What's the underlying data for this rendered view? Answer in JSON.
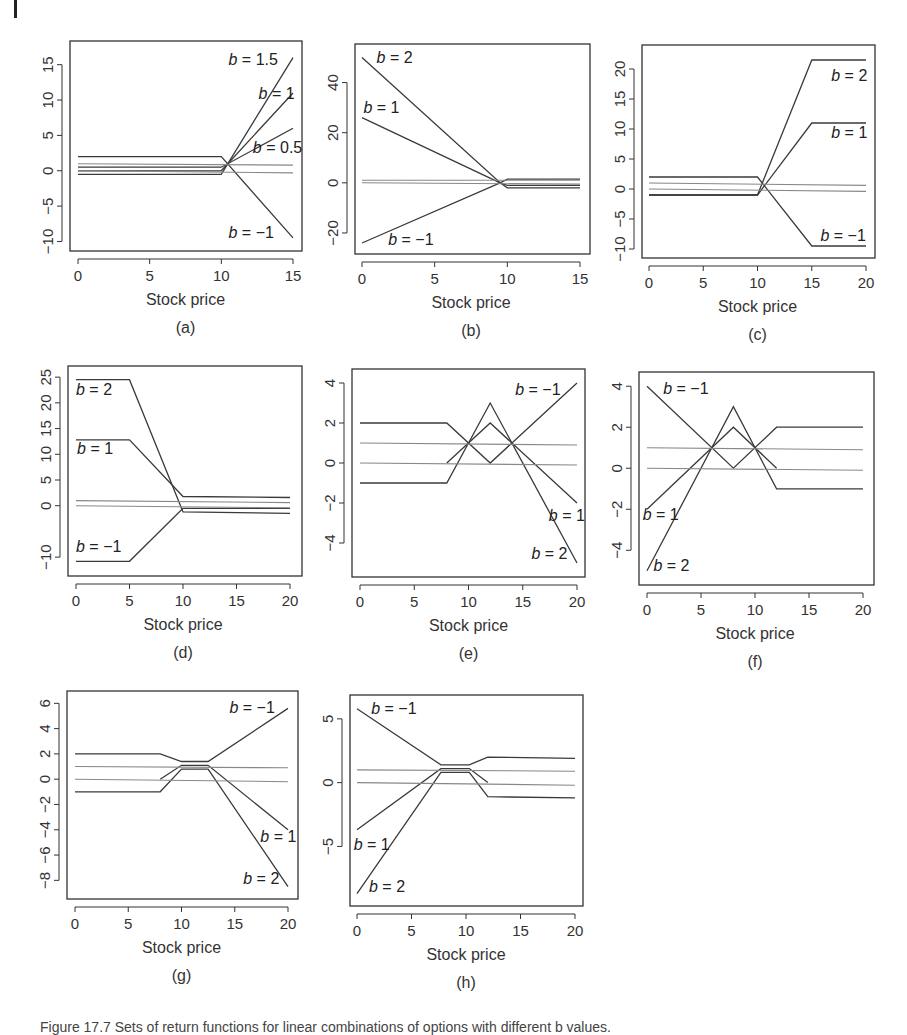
{
  "document": {
    "caption": "Figure 17.7  Sets of return functions for linear combinations of options with different b values."
  },
  "chart_data": [
    {
      "id": "a",
      "type": "line",
      "panel_label": "(a)",
      "xlabel": "Stock price",
      "ylabel": "",
      "xlim": [
        0,
        15
      ],
      "ylim": [
        -10.5,
        17.5
      ],
      "xticks": [
        0,
        5,
        10,
        15
      ],
      "yticks": [
        -10,
        -5,
        0,
        5,
        10,
        15
      ],
      "series": [
        {
          "name": "b=1.5",
          "x": [
            0,
            10,
            15
          ],
          "y": [
            -0.5,
            -0.5,
            16
          ]
        },
        {
          "name": "b=1",
          "x": [
            0,
            10,
            15
          ],
          "y": [
            0,
            0,
            11
          ]
        },
        {
          "name": "b=0.5",
          "x": [
            0,
            10,
            15
          ],
          "y": [
            0.5,
            0.5,
            6
          ]
        },
        {
          "name": "b=-1",
          "x": [
            0,
            10,
            15
          ],
          "y": [
            2,
            2,
            -9.5
          ]
        },
        {
          "name": "ref1",
          "x": [
            0,
            15
          ],
          "y": [
            1,
            0.8
          ],
          "color": "#888"
        },
        {
          "name": "ref0",
          "x": [
            0,
            15
          ],
          "y": [
            0,
            -0.3
          ],
          "color": "#888"
        }
      ],
      "annotations": [
        {
          "text": "b = 1.5",
          "x": 10.5,
          "y": 15
        },
        {
          "text": "b = 1",
          "x": 12.6,
          "y": 10.2
        },
        {
          "text": "b = 0.5",
          "x": 12.2,
          "y": 2.5
        },
        {
          "text": "b = −1",
          "x": 10.5,
          "y": -9.5
        }
      ]
    },
    {
      "id": "b",
      "type": "line",
      "panel_label": "(b)",
      "xlabel": "Stock price",
      "ylabel": "",
      "xlim": [
        0,
        15
      ],
      "ylim": [
        -26,
        53
      ],
      "xticks": [
        0,
        5,
        10,
        15
      ],
      "yticks": [
        -20,
        0,
        20,
        40
      ],
      "series": [
        {
          "name": "b=2",
          "x": [
            0,
            9.5,
            10,
            15
          ],
          "y": [
            50,
            0,
            -1,
            -1
          ]
        },
        {
          "name": "b=1",
          "x": [
            0,
            9.5,
            10,
            15
          ],
          "y": [
            26,
            0,
            -2,
            -2
          ]
        },
        {
          "name": "b=-1",
          "x": [
            0,
            9.5,
            10,
            15
          ],
          "y": [
            -24,
            0,
            1.5,
            1.5
          ]
        },
        {
          "name": "ref1",
          "x": [
            0,
            15
          ],
          "y": [
            1,
            1
          ],
          "color": "#888"
        },
        {
          "name": "ref0",
          "x": [
            0,
            15
          ],
          "y": [
            0,
            -0.5
          ],
          "color": "#888"
        }
      ],
      "annotations": [
        {
          "text": "b = 2",
          "x": 1.0,
          "y": 48
        },
        {
          "text": "b = 1",
          "x": 0.1,
          "y": 28
        },
        {
          "text": "b = −1",
          "x": 1.8,
          "y": -25
        }
      ]
    },
    {
      "id": "c",
      "type": "line",
      "panel_label": "(c)",
      "xlabel": "Stock price",
      "ylabel": "",
      "xlim": [
        0,
        20.5
      ],
      "ylim": [
        -10.5,
        23
      ],
      "xticks": [
        0,
        5,
        10,
        15,
        20
      ],
      "yticks": [
        -10,
        -5,
        0,
        5,
        10,
        15,
        20
      ],
      "series": [
        {
          "name": "b=2",
          "x": [
            0,
            10,
            15,
            20
          ],
          "y": [
            -1,
            -1,
            21.5,
            21.5
          ]
        },
        {
          "name": "b=1",
          "x": [
            0,
            10,
            15,
            20
          ],
          "y": [
            -1,
            -1,
            11,
            11
          ]
        },
        {
          "name": "b=-1",
          "x": [
            0,
            10,
            15,
            20
          ],
          "y": [
            2,
            2,
            -9.5,
            -9.5
          ]
        },
        {
          "name": "ref1",
          "x": [
            0,
            20
          ],
          "y": [
            1,
            0.6
          ],
          "color": "#888"
        },
        {
          "name": "ref0",
          "x": [
            0,
            20
          ],
          "y": [
            0,
            -0.4
          ],
          "color": "#888"
        }
      ],
      "annotations": [
        {
          "text": "b = 2",
          "x": 16.8,
          "y": 18
        },
        {
          "text": "b = 1",
          "x": 16.8,
          "y": 8.5
        },
        {
          "text": "b = −1",
          "x": 15.8,
          "y": -8.6
        }
      ]
    },
    {
      "id": "d",
      "type": "line",
      "panel_label": "(d)",
      "xlabel": "Stock price",
      "ylabel": "",
      "xlim": [
        0,
        20.5
      ],
      "ylim": [
        -12.5,
        26
      ],
      "xticks": [
        0,
        5,
        10,
        15,
        20
      ],
      "yticks": [
        -10,
        0,
        5,
        10,
        15,
        20,
        25
      ],
      "series": [
        {
          "name": "b=2",
          "x": [
            0,
            5,
            10,
            20
          ],
          "y": [
            24.5,
            24.5,
            -1.2,
            -1.5
          ]
        },
        {
          "name": "b=1",
          "x": [
            0,
            5,
            10,
            20
          ],
          "y": [
            12.8,
            12.8,
            1.8,
            1.6
          ]
        },
        {
          "name": "b=-1",
          "x": [
            0,
            5,
            10,
            20
          ],
          "y": [
            -10.8,
            -10.8,
            -0.5,
            -0.5
          ]
        },
        {
          "name": "ref1",
          "x": [
            0,
            20
          ],
          "y": [
            1,
            0.6
          ],
          "color": "#888"
        },
        {
          "name": "ref0",
          "x": [
            0,
            20
          ],
          "y": [
            0,
            -0.4
          ],
          "color": "#888"
        }
      ],
      "annotations": [
        {
          "text": "b = 2",
          "x": 0.0,
          "y": 21.5
        },
        {
          "text": "b = 1",
          "x": 0.1,
          "y": 10
        },
        {
          "text": "b = −1",
          "x": 0.0,
          "y": -9
        }
      ]
    },
    {
      "id": "e",
      "type": "line",
      "panel_label": "(e)",
      "xlabel": "Stock price",
      "ylabel": "",
      "xlim": [
        0,
        20.5
      ],
      "ylim": [
        -5.4,
        4.4
      ],
      "xticks": [
        0,
        5,
        10,
        15,
        20
      ],
      "yticks": [
        -4,
        -2,
        0,
        2,
        4
      ],
      "series": [
        {
          "name": "b=-1",
          "x": [
            0,
            8,
            12,
            16,
            20
          ],
          "y": [
            2,
            2,
            0,
            2,
            4
          ]
        },
        {
          "name": "b=1",
          "x": [
            8,
            12,
            20
          ],
          "y": [
            0,
            2,
            -2
          ]
        },
        {
          "name": "b=2",
          "x": [
            0,
            8,
            12,
            20
          ],
          "y": [
            -1,
            -1,
            3,
            -5
          ]
        },
        {
          "name": "ref1",
          "x": [
            0,
            20
          ],
          "y": [
            1,
            0.9
          ],
          "color": "#888"
        },
        {
          "name": "ref0",
          "x": [
            0,
            20
          ],
          "y": [
            0,
            -0.1
          ],
          "color": "#888"
        }
      ],
      "annotations": [
        {
          "text": "b = −1",
          "x": 14.3,
          "y": 3.4
        },
        {
          "text": "b = 1",
          "x": 17.4,
          "y": -2.9
        },
        {
          "text": "b = 2",
          "x": 15.8,
          "y": -4.8
        }
      ]
    },
    {
      "id": "f",
      "type": "line",
      "panel_label": "(f)",
      "xlabel": "Stock price",
      "ylabel": "",
      "xlim": [
        0,
        20.5
      ],
      "ylim": [
        -5.4,
        4.4
      ],
      "xticks": [
        0,
        5,
        10,
        15,
        20
      ],
      "yticks": [
        -4,
        -2,
        0,
        2,
        4
      ],
      "series": [
        {
          "name": "b=-1",
          "x": [
            0,
            8,
            12,
            20
          ],
          "y": [
            4,
            0,
            2,
            2
          ]
        },
        {
          "name": "b=1",
          "x": [
            0,
            8,
            12
          ],
          "y": [
            -2,
            2,
            0
          ]
        },
        {
          "name": "b=2",
          "x": [
            0,
            8,
            12,
            20
          ],
          "y": [
            -5,
            3,
            -1,
            -1
          ]
        },
        {
          "name": "ref1",
          "x": [
            0,
            20
          ],
          "y": [
            1,
            0.9
          ],
          "color": "#888"
        },
        {
          "name": "ref0",
          "x": [
            0,
            20
          ],
          "y": [
            0,
            -0.1
          ],
          "color": "#888"
        }
      ],
      "annotations": [
        {
          "text": "b = −1",
          "x": 1.5,
          "y": 3.6
        },
        {
          "text": "b = 1",
          "x": -0.4,
          "y": -2.5
        },
        {
          "text": "b = 2",
          "x": 0.6,
          "y": -5.0
        }
      ]
    },
    {
      "id": "g",
      "type": "line",
      "panel_label": "(g)",
      "xlabel": "Stock price",
      "ylabel": "",
      "xlim": [
        0,
        20.5
      ],
      "ylim": [
        -9,
        6.5
      ],
      "xticks": [
        0,
        5,
        10,
        15,
        20
      ],
      "yticks": [
        -8,
        -6,
        -4,
        -2,
        0,
        2,
        4,
        6
      ],
      "series": [
        {
          "name": "b=-1",
          "x": [
            0,
            8,
            10,
            12.5,
            20
          ],
          "y": [
            2,
            2,
            1.4,
            1.4,
            5.6
          ]
        },
        {
          "name": "b=1",
          "x": [
            8,
            10,
            12.5,
            20
          ],
          "y": [
            0,
            1.1,
            1.1,
            -4
          ]
        },
        {
          "name": "b=2",
          "x": [
            0,
            8,
            10,
            12.5,
            20
          ],
          "y": [
            -1,
            -1,
            0.8,
            0.8,
            -8.5
          ]
        },
        {
          "name": "ref1",
          "x": [
            0,
            20
          ],
          "y": [
            1,
            0.9
          ],
          "color": "#888"
        },
        {
          "name": "ref0",
          "x": [
            0,
            20
          ],
          "y": [
            0,
            -0.2
          ],
          "color": "#888"
        }
      ],
      "annotations": [
        {
          "text": "b = −1",
          "x": 14.5,
          "y": 5.2
        },
        {
          "text": "b = 1",
          "x": 17.4,
          "y": -5.0
        },
        {
          "text": "b = 2",
          "x": 15.8,
          "y": -8.3
        }
      ]
    },
    {
      "id": "h",
      "type": "line",
      "panel_label": "(h)",
      "xlabel": "Stock price",
      "ylabel": "",
      "xlim": [
        0,
        20.5
      ],
      "ylim": [
        -9.2,
        6.4
      ],
      "xticks": [
        0,
        5,
        10,
        15,
        20
      ],
      "yticks": [
        -5,
        0,
        5
      ],
      "series": [
        {
          "name": "b=-1",
          "x": [
            0,
            7.7,
            10.3,
            12,
            20
          ],
          "y": [
            5.8,
            1.4,
            1.4,
            2,
            1.9
          ]
        },
        {
          "name": "b=1",
          "x": [
            0,
            7.7,
            10.3,
            12
          ],
          "y": [
            -3.7,
            1.1,
            1.1,
            0
          ]
        },
        {
          "name": "b=2",
          "x": [
            0,
            7.7,
            10.3,
            12,
            20
          ],
          "y": [
            -8.7,
            0.8,
            0.8,
            -1.1,
            -1.2
          ]
        },
        {
          "name": "ref1",
          "x": [
            0,
            20
          ],
          "y": [
            1,
            0.9
          ],
          "color": "#888"
        },
        {
          "name": "ref0",
          "x": [
            0,
            20
          ],
          "y": [
            0,
            -0.2
          ],
          "color": "#888"
        }
      ],
      "annotations": [
        {
          "text": "b = −1",
          "x": 1.3,
          "y": 5.4
        },
        {
          "text": "b = 1",
          "x": -0.3,
          "y": -5.3
        },
        {
          "text": "b = 2",
          "x": 1.1,
          "y": -8.6
        }
      ]
    }
  ],
  "layout": {
    "panels": [
      {
        "id": "a",
        "box": [
          70,
          41,
          232,
          210
        ],
        "x0": 78,
        "x1": 293
      },
      {
        "id": "b",
        "box": [
          355,
          44,
          235,
          210
        ],
        "x0": 362,
        "x1": 580
      },
      {
        "id": "c",
        "box": [
          642,
          45,
          233,
          213
        ],
        "x0": 649,
        "x1": 866
      },
      {
        "id": "d",
        "box": [
          68,
          366,
          234,
          210
        ],
        "x0": 76,
        "x1": 290
      },
      {
        "id": "e",
        "box": [
          352,
          369,
          233,
          208
        ],
        "x0": 360,
        "x1": 577
      },
      {
        "id": "f",
        "box": [
          639,
          372,
          235,
          213
        ],
        "x0": 647,
        "x1": 863
      },
      {
        "id": "g",
        "box": [
          67,
          691,
          231,
          208
        ],
        "x0": 75,
        "x1": 288
      },
      {
        "id": "h",
        "box": [
          350,
          695,
          233,
          211
        ],
        "x0": 357,
        "x1": 575
      }
    ]
  }
}
